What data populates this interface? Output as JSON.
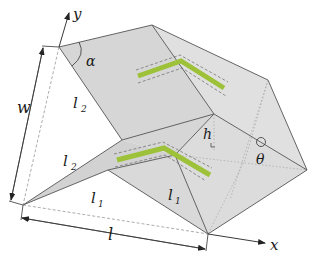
{
  "figure": {
    "colors": {
      "face_fill": "#d9d9d9",
      "face_fill_light": "#e3e3e3",
      "face_fill_dark": "#cfcfcf",
      "edge": "#555555",
      "dashed": "#7a7a7a",
      "stripe": "#9dc23a",
      "text": "#1a1a1a"
    },
    "axes": {
      "x_label": "x",
      "y_label": "y"
    },
    "labels": {
      "alpha": "α",
      "theta": "θ",
      "h": "h",
      "w": "w",
      "l": "l",
      "l1_base": "l",
      "l1_sub": "1",
      "l2_base": "l",
      "l2_sub": "2"
    },
    "label_instances": [
      {
        "id": "l2-upper",
        "base": "l",
        "sub": "2"
      },
      {
        "id": "l2-lower",
        "base": "l",
        "sub": "2"
      },
      {
        "id": "l1-left",
        "base": "l",
        "sub": "1"
      },
      {
        "id": "l1-right",
        "base": "l",
        "sub": "1"
      }
    ]
  }
}
